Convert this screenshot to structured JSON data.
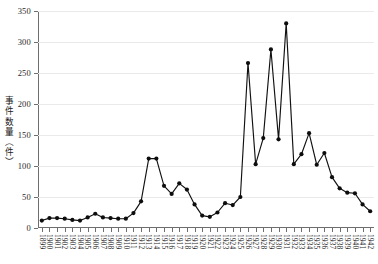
{
  "chart_data": {
    "type": "line",
    "title": "",
    "subtitle": "",
    "xlabel": "",
    "ylabel": "事件数量（件）",
    "ylim": [
      0,
      350
    ],
    "yticks": [
      0,
      50,
      100,
      150,
      200,
      250,
      300,
      350
    ],
    "grid": true,
    "legend": null,
    "marker": "filled-circle",
    "line_color": "#111111",
    "marker_color": "#0d0d0d",
    "grid_color": "#eaeaea",
    "axis_color": "#6e6e6e",
    "categories": [
      "1899",
      "1900",
      "1901",
      "1902",
      "1903",
      "1904",
      "1905",
      "1906",
      "1907",
      "1908",
      "1909",
      "1910",
      "1911",
      "1912",
      "1913",
      "1914",
      "1915",
      "1916",
      "1917",
      "1918",
      "1919",
      "1920",
      "1921",
      "1922",
      "1923",
      "1924",
      "1925",
      "1926",
      "1927",
      "1928",
      "1929",
      "1930",
      "1931",
      "1932",
      "1933",
      "1934",
      "1935",
      "1936",
      "1937",
      "1938",
      "1939",
      "1940",
      "1941",
      "1942"
    ],
    "values": [
      12,
      16,
      16,
      15,
      13,
      12,
      17,
      23,
      17,
      16,
      15,
      15,
      24,
      43,
      112,
      112,
      68,
      55,
      72,
      62,
      38,
      20,
      18,
      25,
      40,
      37,
      50,
      266,
      103,
      145,
      288,
      143,
      330,
      103,
      119,
      153,
      102,
      121,
      82,
      64,
      57,
      56,
      38,
      27
    ],
    "annotations": []
  }
}
